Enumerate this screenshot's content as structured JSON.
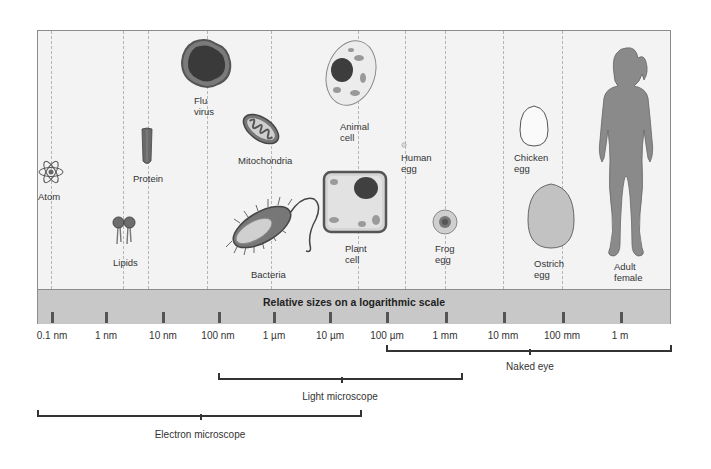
{
  "figure": {
    "band_title": "Relative sizes on a logarithmic scale",
    "scale_ticks": [
      "0.1 nm",
      "1 nm",
      "10 nm",
      "100 nm",
      "1 µm",
      "10 µm",
      "100 µm",
      "1 mm",
      "10 mm",
      "100 mm",
      "1 m"
    ],
    "objects": [
      {
        "name": "atom",
        "label": "Atom"
      },
      {
        "name": "lipids",
        "label": "Lipids"
      },
      {
        "name": "protein",
        "label": "Protein"
      },
      {
        "name": "flu-virus",
        "label_line1": "Flu",
        "label_line2": "virus"
      },
      {
        "name": "mitochondria",
        "label": "Mitochondria"
      },
      {
        "name": "bacteria",
        "label": "Bacteria"
      },
      {
        "name": "animal-cell",
        "label_line1": "Animal",
        "label_line2": "cell"
      },
      {
        "name": "plant-cell",
        "label_line1": "Plant",
        "label_line2": "cell"
      },
      {
        "name": "human-egg",
        "label_line1": "Human",
        "label_line2": "egg"
      },
      {
        "name": "frog-egg",
        "label_line1": "Frog",
        "label_line2": "egg"
      },
      {
        "name": "chicken-egg",
        "label_line1": "Chicken",
        "label_line2": "egg"
      },
      {
        "name": "ostrich-egg",
        "label_line1": "Ostrich",
        "label_line2": "egg"
      },
      {
        "name": "adult-female",
        "label_line1": "Adult",
        "label_line2": "female"
      }
    ],
    "ranges": [
      {
        "label": "Naked eye",
        "from": "100 µm",
        "to": "1 m+"
      },
      {
        "label": "Light microscope",
        "from": "100 nm",
        "to": "1 mm+"
      },
      {
        "label": "Electron microscope",
        "from": "<0.1 nm",
        "to": "100 µm"
      }
    ]
  },
  "colors": {
    "panel_bg": "#f3f3f3",
    "band_bg": "#c8c8c8",
    "frame_border": "#8c8c8c",
    "ink": "#333333"
  }
}
